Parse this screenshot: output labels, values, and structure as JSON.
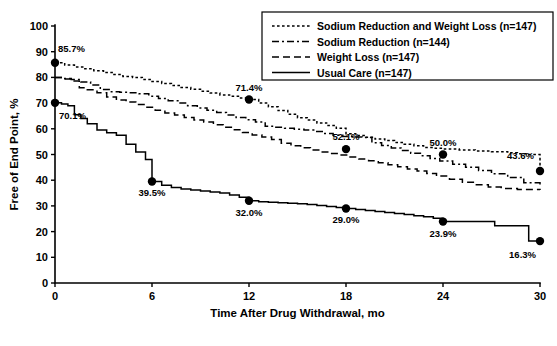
{
  "chart_data": {
    "type": "line",
    "title": "",
    "xlabel": "Time After Drug Withdrawal, mo",
    "ylabel": "Free of End Point, %",
    "xlim": [
      0,
      30
    ],
    "ylim": [
      0,
      100
    ],
    "xticks": [
      0,
      6,
      12,
      18,
      24,
      30
    ],
    "yticks": [
      0,
      10,
      20,
      30,
      40,
      50,
      60,
      70,
      80,
      90,
      100
    ],
    "grid": false,
    "legend_position": "top-right",
    "series": [
      {
        "name": "Sodium Reduction and Weight Loss (n=147)",
        "n": 147,
        "style": "dotted",
        "annotations": [
          {
            "x": 0,
            "y": 85.7,
            "label": "85.7%"
          },
          {
            "x": 12,
            "y": 71.4,
            "label": "71.4%"
          },
          {
            "x": 18,
            "y": 52.1,
            "label": "52.1%"
          },
          {
            "x": 24,
            "y": 50.0,
            "label": "50.0%"
          },
          {
            "x": 30,
            "y": 43.6,
            "label": "43.6%"
          }
        ],
        "x": [
          0,
          0.6,
          1.2,
          1.8,
          2.4,
          3.0,
          3.6,
          4.2,
          4.8,
          5.4,
          6.0,
          6.6,
          7.2,
          7.8,
          8.4,
          9.0,
          9.6,
          10.2,
          10.8,
          11.4,
          12.0,
          12.6,
          13.2,
          13.8,
          14.4,
          15.0,
          15.6,
          16.2,
          16.8,
          17.4,
          18.0,
          18.6,
          19.2,
          19.8,
          20.4,
          21.0,
          21.6,
          22.2,
          22.8,
          23.4,
          24.0,
          25.0,
          26.0,
          27.0,
          28.0,
          28.6,
          29.2,
          30.0
        ],
        "y": [
          85.7,
          84.8,
          84.1,
          83.4,
          82.6,
          81.9,
          81.1,
          80.4,
          80.0,
          79.2,
          78.4,
          77.6,
          76.9,
          76.1,
          75.4,
          74.6,
          73.9,
          73.2,
          72.7,
          72.0,
          71.4,
          70.0,
          68.6,
          67.1,
          65.7,
          64.3,
          63.4,
          62.3,
          61.3,
          60.2,
          58.1,
          57.4,
          56.7,
          56.0,
          55.4,
          54.7,
          54.0,
          53.4,
          52.7,
          52.4,
          52.1,
          51.8,
          51.4,
          51.1,
          50.7,
          50.3,
          50.0,
          43.6
        ]
      },
      {
        "name": "Sodium Reduction (n=144)",
        "n": 144,
        "style": "dashdot",
        "annotations": [],
        "x": [
          0,
          0.5,
          1.0,
          1.6,
          2.2,
          2.8,
          3.4,
          4.0,
          4.6,
          5.2,
          5.8,
          6.4,
          7.0,
          7.6,
          8.2,
          8.8,
          9.4,
          10.0,
          10.6,
          11.2,
          11.8,
          12.4,
          13.0,
          13.6,
          14.2,
          14.8,
          15.4,
          16.0,
          16.6,
          17.2,
          17.8,
          18.4,
          19.0,
          19.6,
          20.2,
          20.8,
          21.4,
          22.0,
          22.6,
          23.2,
          23.8,
          24.6,
          25.4,
          26.2,
          27.0,
          28.0,
          29.0,
          30.0
        ],
        "y": [
          80.0,
          79.6,
          79.2,
          78.2,
          77.0,
          75.3,
          74.4,
          74.2,
          74.0,
          73.6,
          72.7,
          71.8,
          70.9,
          70.0,
          69.0,
          68.1,
          67.2,
          66.3,
          65.4,
          64.4,
          63.5,
          62.6,
          61.0,
          60.6,
          60.2,
          59.8,
          59.5,
          59.0,
          58.2,
          57.5,
          57.0,
          56.8,
          56.6,
          54.6,
          53.5,
          52.5,
          51.5,
          50.5,
          49.5,
          48.5,
          47.5,
          46.2,
          45.0,
          43.8,
          42.5,
          41.0,
          39.0,
          38.0
        ]
      },
      {
        "name": "Weight Loss (n=147)",
        "n": 147,
        "style": "dashed",
        "annotations": [],
        "x": [
          0,
          0.5,
          1.0,
          1.5,
          2.0,
          2.6,
          3.2,
          3.8,
          4.4,
          5.0,
          5.6,
          6.2,
          6.8,
          7.4,
          8.0,
          8.6,
          9.2,
          9.8,
          10.4,
          11.0,
          11.6,
          12.2,
          12.8,
          13.4,
          14.0,
          14.6,
          15.2,
          15.8,
          16.4,
          17.0,
          17.6,
          18.2,
          18.8,
          19.4,
          20.0,
          20.6,
          21.2,
          21.8,
          22.4,
          23.0,
          23.6,
          24.4,
          25.2,
          26.0,
          26.8,
          27.6,
          28.6,
          30.0
        ],
        "y": [
          80.0,
          79.4,
          78.6,
          76.0,
          75.2,
          74.0,
          72.4,
          71.2,
          70.4,
          69.4,
          68.4,
          67.2,
          66.2,
          65.4,
          64.4,
          63.4,
          62.6,
          61.6,
          60.6,
          59.6,
          58.6,
          57.6,
          56.8,
          55.8,
          54.4,
          53.4,
          52.6,
          51.8,
          51.0,
          50.4,
          49.8,
          49.0,
          48.2,
          47.6,
          46.8,
          46.0,
          45.2,
          44.4,
          43.6,
          42.6,
          41.6,
          40.4,
          39.2,
          38.2,
          37.4,
          36.8,
          36.4,
          36.2
        ]
      },
      {
        "name": "Usual Care (n=147)",
        "n": 147,
        "style": "solid",
        "annotations": [
          {
            "x": 0,
            "y": 70.1,
            "label": "70.1%"
          },
          {
            "x": 6,
            "y": 39.5,
            "label": "39.5%"
          },
          {
            "x": 12,
            "y": 32.0,
            "label": "32.0%"
          },
          {
            "x": 18,
            "y": 29.0,
            "label": "29.0%"
          },
          {
            "x": 24,
            "y": 23.9,
            "label": "23.9%"
          },
          {
            "x": 30,
            "y": 16.3,
            "label": "16.3%"
          }
        ],
        "x": [
          0,
          0.4,
          0.8,
          1.2,
          1.6,
          2.0,
          2.6,
          3.2,
          3.8,
          4.4,
          5.0,
          5.6,
          6.0,
          6.6,
          7.2,
          7.8,
          8.4,
          9.0,
          9.6,
          10.2,
          10.8,
          11.4,
          12.0,
          12.6,
          13.2,
          13.8,
          14.4,
          15.0,
          15.6,
          16.2,
          16.8,
          17.4,
          18.0,
          18.6,
          19.2,
          19.8,
          20.4,
          21.0,
          21.6,
          22.2,
          22.8,
          23.4,
          24.0,
          25.2,
          26.4,
          27.2,
          27.8,
          29.0,
          29.3,
          30.0
        ],
        "y": [
          70.1,
          69.6,
          69.0,
          65.5,
          64.0,
          62.0,
          59.5,
          58.5,
          57.5,
          54.0,
          51.0,
          48.0,
          39.5,
          38.0,
          37.2,
          36.6,
          36.2,
          35.8,
          35.4,
          35.0,
          34.2,
          33.4,
          32.0,
          31.6,
          31.4,
          31.2,
          31.0,
          30.8,
          30.6,
          30.2,
          29.8,
          29.4,
          29.0,
          28.6,
          28.2,
          27.8,
          27.4,
          27.0,
          26.6,
          26.2,
          25.8,
          25.2,
          23.9,
          23.9,
          23.9,
          22.3,
          22.3,
          22.3,
          16.3,
          16.3
        ]
      }
    ]
  },
  "legend": {
    "entries": [
      {
        "label": "Sodium Reduction and Weight Loss (n=147)",
        "style": "dotted"
      },
      {
        "label": "Sodium Reduction (n=144)",
        "style": "dashdot"
      },
      {
        "label": "Weight Loss (n=147)",
        "style": "dashed"
      },
      {
        "label": "Usual Care (n=147)",
        "style": "solid"
      }
    ]
  },
  "colors": {
    "ink": "#000000",
    "background": "#ffffff"
  }
}
